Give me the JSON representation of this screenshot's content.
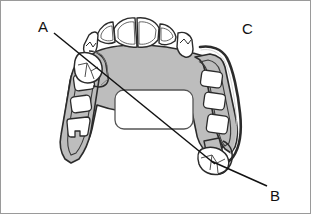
{
  "figure": {
    "background_color": "#ffffff",
    "border_color": "#9a9a9a",
    "framework_fill": "#bdbdbd",
    "framework_outline": "#2b2b2b",
    "tooth_fill": "#ffffff",
    "tooth_outline": "#2b2b2b",
    "leader_line_color": "#111111"
  },
  "labels": [
    {
      "id": "A",
      "text": "A",
      "x": 37,
      "y": 18,
      "points_to": "left-side clasp assembly on premolar",
      "leader": {
        "x1": 53,
        "y1": 32,
        "x2": 214,
        "y2": 163
      }
    },
    {
      "id": "B",
      "text": "B",
      "x": 269,
      "y": 187,
      "points_to": "right-side molar rest / clasp assembly",
      "leader": {
        "x1": 214,
        "y1": 163,
        "x2": 266,
        "y2": 185
      }
    },
    {
      "id": "C",
      "text": "C",
      "x": 241,
      "y": 20,
      "points_to": "right posterior retentive arm extension",
      "leader": null
    }
  ],
  "components": {
    "anterior_teeth_count": 4,
    "canine_teeth_count": 2,
    "left_window_count": 3,
    "right_window_count": 3,
    "palatal_opening": "large rounded rectangle",
    "left_clasp_tooth": "premolar with embrasure clasp",
    "right_clasp_tooth": "molar with occlusal rest"
  }
}
